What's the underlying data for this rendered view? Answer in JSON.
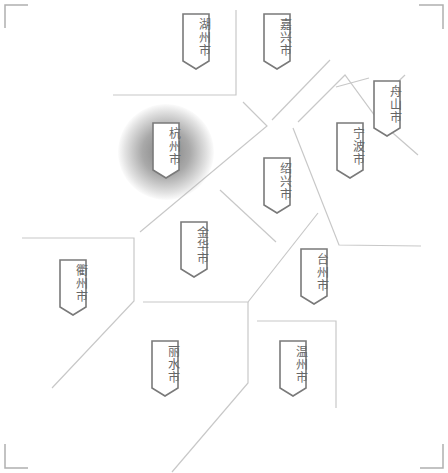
{
  "map": {
    "region_name": "浙江省",
    "line_color": "#c8c8c8",
    "tag_border_color": "#7a7a7a",
    "tag_text_color": "#666666",
    "highlight_color": "#8c8c8c",
    "selected_city": "杭州市",
    "cities": [
      {
        "id": "huzhou",
        "name": "湖州市",
        "x": 182,
        "y": 13,
        "selected": false
      },
      {
        "id": "jiaxing",
        "name": "嘉兴市",
        "x": 263,
        "y": 13,
        "selected": false
      },
      {
        "id": "zhoushan",
        "name": "舟山市",
        "x": 373,
        "y": 80,
        "selected": false
      },
      {
        "id": "hangzhou",
        "name": "杭州市",
        "x": 152,
        "y": 122,
        "selected": true
      },
      {
        "id": "ningbo",
        "name": "宁波市",
        "x": 336,
        "y": 122,
        "selected": false
      },
      {
        "id": "shaoxing",
        "name": "绍兴市",
        "x": 263,
        "y": 157,
        "selected": false
      },
      {
        "id": "jinhua",
        "name": "金华市",
        "x": 180,
        "y": 221,
        "selected": false
      },
      {
        "id": "taizhou",
        "name": "台州市",
        "x": 300,
        "y": 248,
        "selected": false
      },
      {
        "id": "quzhou",
        "name": "衢州市",
        "x": 59,
        "y": 259,
        "selected": false
      },
      {
        "id": "lishui",
        "name": "丽水市",
        "x": 151,
        "y": 340,
        "selected": false
      },
      {
        "id": "wenzhou",
        "name": "温州市",
        "x": 279,
        "y": 340,
        "selected": false
      }
    ]
  }
}
